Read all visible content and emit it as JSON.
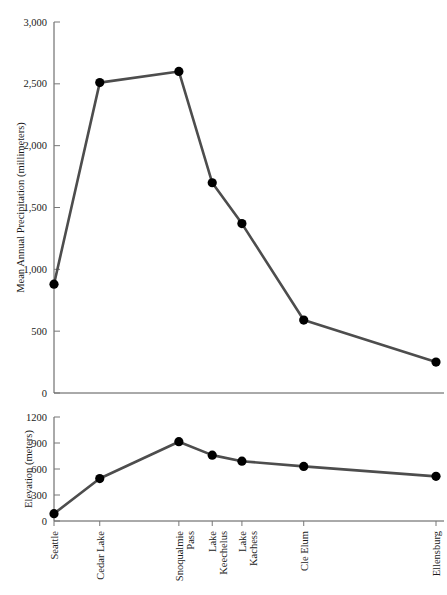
{
  "chart_data": [
    {
      "type": "line",
      "panel": "top",
      "title": "",
      "xlabel": "",
      "ylabel": "Mean Annual Precipitation (millimeters)",
      "categories": [
        "Seattle",
        "Cedar Lake",
        "Snoqualmie Pass",
        "Lake Keechelus",
        "Lake Kachess",
        "Cle Elum",
        "Ellensburg"
      ],
      "x": [
        0,
        37,
        101,
        128,
        152,
        202,
        309
      ],
      "values": [
        880,
        2510,
        2600,
        1700,
        1370,
        590,
        250
      ],
      "ylim": [
        0,
        3000
      ],
      "yticks": [
        0,
        500,
        1000,
        1500,
        2000,
        2500,
        3000
      ],
      "ytick_labels": [
        "0",
        "500",
        "1,000",
        "1,500",
        "2,000",
        "2,500",
        "3,000"
      ],
      "grid": false,
      "legend": "none",
      "line_color": "#4d4d4d",
      "marker_color": "#000000"
    },
    {
      "type": "line",
      "panel": "bottom",
      "title": "",
      "xlabel": "",
      "ylabel": "Elevation (meters)",
      "categories": [
        "Seattle",
        "Cedar Lake",
        "Snoqualmie Pass",
        "Lake Keechelus",
        "Lake Kachess",
        "Cle Elum",
        "Ellensburg"
      ],
      "x": [
        0,
        37,
        101,
        128,
        152,
        202,
        309
      ],
      "values": [
        85,
        490,
        915,
        760,
        690,
        630,
        515
      ],
      "ylim": [
        0,
        1200
      ],
      "yticks": [
        0,
        300,
        600,
        900,
        1200
      ],
      "ytick_labels": [
        "0",
        "300",
        "600",
        "900",
        "1200"
      ],
      "grid": false,
      "legend": "none",
      "line_color": "#4d4d4d",
      "marker_color": "#000000"
    }
  ],
  "axes": {
    "top": {
      "y_axis_title": "Mean Annual Precipitation (millimeters)"
    },
    "bottom": {
      "y_axis_title": "Elevation (meters)"
    }
  },
  "category_labels": [
    "Seattle",
    "Cedar Lake",
    "Snoqualmie Pass",
    "Lake Keechelus",
    "Lake Kachess",
    "Cle Elum",
    "Ellensburg"
  ],
  "category_label_lines": [
    [
      "Seattle"
    ],
    [
      "Cedar Lake"
    ],
    [
      "Snoqualmie",
      "Pass"
    ],
    [
      "Lake",
      "Keechelus"
    ],
    [
      "Lake",
      "Kachess"
    ],
    [
      "Cle Elum"
    ],
    [
      "Ellensburg"
    ]
  ]
}
